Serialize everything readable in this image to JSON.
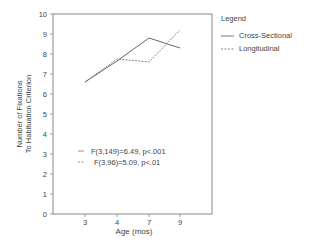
{
  "chart_data": {
    "type": "line",
    "title": "",
    "xlabel": "Age (mos)",
    "ylabel": "Number of Fixations To Habituation Criterion",
    "ylabel_lines": [
      "Number of Fixations",
      "To Habituation Criterion"
    ],
    "categories": [
      "3",
      "4",
      "7",
      "9"
    ],
    "yticks": [
      "0",
      "1",
      "2",
      "3",
      "4",
      "5",
      "6",
      "7",
      "8",
      "9",
      "10"
    ],
    "ylim": [
      0,
      10
    ],
    "grid": false,
    "legend": {
      "title": "Legend",
      "position": "right",
      "entries": [
        "Cross-Sectional",
        "Longitudinal"
      ]
    },
    "series": [
      {
        "name": "Cross-Sectional",
        "style": "solid",
        "values": [
          6.6,
          7.65,
          8.8,
          8.3
        ]
      },
      {
        "name": "Longitudinal",
        "style": "dashed",
        "values": [
          6.6,
          7.75,
          7.6,
          9.2
        ]
      }
    ],
    "annotations": [
      {
        "marker": "—",
        "text": "F(3,149)=6.49, p<.001"
      },
      {
        "marker": "--",
        "text": "F(3,96)=5.09, p<.01"
      }
    ]
  }
}
